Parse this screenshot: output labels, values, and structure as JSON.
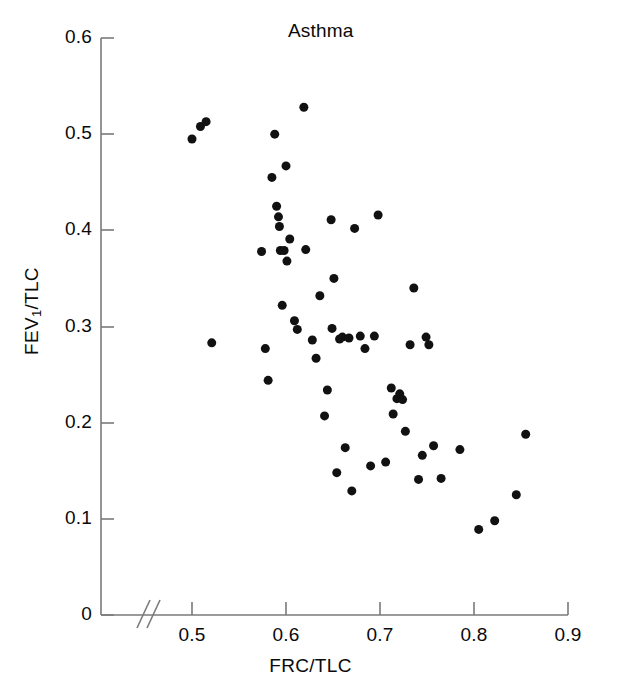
{
  "chart_data": {
    "type": "scatter",
    "title": "Asthma",
    "xlabel": "FRC/TLC",
    "ylabel": "FEV1/TLC",
    "ylabel_base": "FEV",
    "ylabel_sub": "1",
    "ylabel_rest": "/TLC",
    "xlim": [
      0.44,
      0.9
    ],
    "ylim": [
      0,
      0.6
    ],
    "xticks": [
      0.5,
      0.6,
      0.7,
      0.8,
      0.9
    ],
    "xtick_labels": [
      "0.5",
      "0.6",
      "0.7",
      "0.8",
      "0.9"
    ],
    "yticks": [
      0,
      0.1,
      0.2,
      0.3,
      0.4,
      0.5,
      0.6
    ],
    "ytick_labels": [
      "0",
      "0.1",
      "0.2",
      "0.3",
      "0.4",
      "0.5",
      "0.6"
    ],
    "grid": false,
    "legend": null,
    "axis_break": true,
    "axis_break_note": "double slash break on x-axis between 0 and 0.5",
    "marker": "filled-circle",
    "marker_color": "#111111",
    "marker_size_px": 9,
    "n_points": 62,
    "points": [
      [
        0.5,
        0.495
      ],
      [
        0.509,
        0.508
      ],
      [
        0.515,
        0.513
      ],
      [
        0.521,
        0.283
      ],
      [
        0.574,
        0.378
      ],
      [
        0.578,
        0.277
      ],
      [
        0.581,
        0.244
      ],
      [
        0.585,
        0.455
      ],
      [
        0.588,
        0.5
      ],
      [
        0.59,
        0.425
      ],
      [
        0.592,
        0.414
      ],
      [
        0.593,
        0.404
      ],
      [
        0.594,
        0.379
      ],
      [
        0.596,
        0.322
      ],
      [
        0.598,
        0.379
      ],
      [
        0.6,
        0.467
      ],
      [
        0.601,
        0.368
      ],
      [
        0.604,
        0.391
      ],
      [
        0.609,
        0.306
      ],
      [
        0.612,
        0.297
      ],
      [
        0.619,
        0.528
      ],
      [
        0.621,
        0.38
      ],
      [
        0.628,
        0.286
      ],
      [
        0.632,
        0.267
      ],
      [
        0.636,
        0.332
      ],
      [
        0.641,
        0.207
      ],
      [
        0.644,
        0.234
      ],
      [
        0.648,
        0.411
      ],
      [
        0.651,
        0.35
      ],
      [
        0.654,
        0.148
      ],
      [
        0.657,
        0.287
      ],
      [
        0.66,
        0.289
      ],
      [
        0.663,
        0.174
      ],
      [
        0.667,
        0.288
      ],
      [
        0.67,
        0.129
      ],
      [
        0.673,
        0.402
      ],
      [
        0.679,
        0.29
      ],
      [
        0.684,
        0.277
      ],
      [
        0.69,
        0.155
      ],
      [
        0.694,
        0.29
      ],
      [
        0.698,
        0.416
      ],
      [
        0.706,
        0.159
      ],
      [
        0.712,
        0.236
      ],
      [
        0.714,
        0.209
      ],
      [
        0.718,
        0.225
      ],
      [
        0.721,
        0.23
      ],
      [
        0.724,
        0.224
      ],
      [
        0.727,
        0.191
      ],
      [
        0.732,
        0.281
      ],
      [
        0.736,
        0.34
      ],
      [
        0.741,
        0.141
      ],
      [
        0.745,
        0.166
      ],
      [
        0.749,
        0.289
      ],
      [
        0.752,
        0.281
      ],
      [
        0.757,
        0.176
      ],
      [
        0.765,
        0.142
      ],
      [
        0.785,
        0.172
      ],
      [
        0.805,
        0.089
      ],
      [
        0.822,
        0.098
      ],
      [
        0.845,
        0.125
      ],
      [
        0.855,
        0.188
      ],
      [
        0.649,
        0.298
      ]
    ]
  },
  "axes": {
    "axis_color": "#7a7a7a",
    "tick_color": "#7a7a7a"
  }
}
